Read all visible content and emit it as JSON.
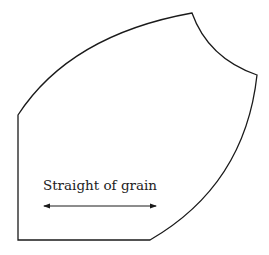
{
  "diagram": {
    "type": "sewing-pattern-piece",
    "grainline": {
      "label": "Straight of grain",
      "arrow": "double-headed horizontal"
    },
    "colors": {
      "stroke": "#1a1a1a",
      "background": "#ffffff",
      "text": "#222222"
    }
  }
}
